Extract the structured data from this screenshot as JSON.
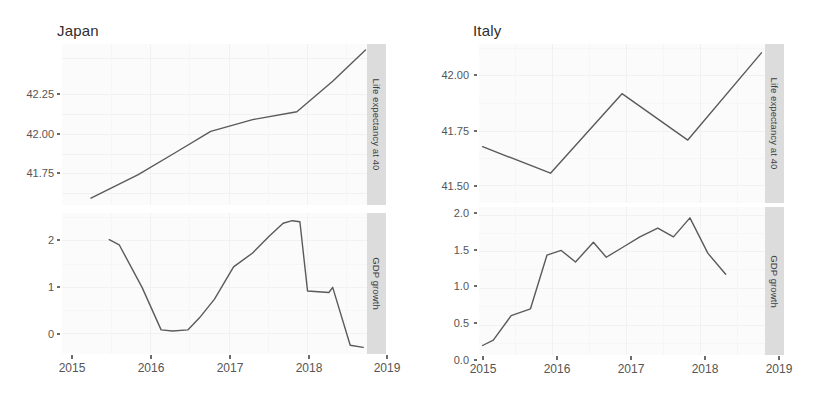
{
  "figure": {
    "background": "#ffffff",
    "panel_background": "#fbfbfb",
    "grid_color": "#f1f1f1",
    "strip_background": "#dcdcdc",
    "line_color": "#5a5a5a"
  },
  "facets": {
    "columns": [
      {
        "title": "Japan"
      },
      {
        "title": "Italy"
      }
    ],
    "rows": [
      {
        "strip_label": "Life expectancy at 40"
      },
      {
        "strip_label": "GDP growth"
      }
    ]
  },
  "axes": {
    "x_ticks": [
      "2015",
      "2016",
      "2017",
      "2018",
      "2019"
    ],
    "japan_life_y_ticks": [
      "42.25",
      "42.00",
      "41.75"
    ],
    "japan_gdp_y_ticks": [
      "2",
      "1",
      "0"
    ],
    "italy_life_y_ticks": [
      "42.00",
      "41.75",
      "41.50"
    ],
    "italy_gdp_y_ticks": [
      "2.0",
      "1.5",
      "1.0",
      "0.5",
      "0.0"
    ]
  },
  "chart_data": [
    {
      "type": "line",
      "title": "Japan",
      "ylabel": "Life expectancy at 40",
      "xlabel": "",
      "xlim": [
        2015.0,
        2019.0
      ],
      "ylim": [
        41.63,
        42.45
      ],
      "grid": true,
      "legend": "none",
      "yticks": [
        41.75,
        42.0,
        42.25
      ],
      "xticks": [
        2015,
        2016,
        2017,
        2018,
        2019
      ],
      "series": [
        {
          "name": "Life expectancy at 40",
          "x": [
            2015.38,
            2016.0,
            2016.5,
            2016.95,
            2017.5,
            2018.08,
            2018.55,
            2018.98
          ],
          "y": [
            41.665,
            41.785,
            41.9,
            42.005,
            42.065,
            42.105,
            42.26,
            42.42
          ]
        }
      ]
    },
    {
      "type": "line",
      "title": "Japan",
      "ylabel": "GDP growth",
      "xlabel": "",
      "xlim": [
        2015.0,
        2019.0
      ],
      "ylim": [
        -0.25,
        2.5
      ],
      "grid": true,
      "legend": "none",
      "yticks": [
        0,
        1,
        2
      ],
      "xticks": [
        2015,
        2016,
        2017,
        2018,
        2019
      ],
      "series": [
        {
          "name": "GDP growth",
          "x": [
            2015.62,
            2015.75,
            2016.05,
            2016.3,
            2016.45,
            2016.65,
            2016.8,
            2017.0,
            2017.25,
            2017.5,
            2017.72,
            2017.9,
            2018.02,
            2018.12,
            2018.22,
            2018.5,
            2018.55,
            2018.78,
            2018.95
          ],
          "y": [
            1.98,
            1.88,
            1.05,
            0.22,
            0.2,
            0.22,
            0.45,
            0.82,
            1.45,
            1.72,
            2.05,
            2.3,
            2.35,
            2.33,
            0.98,
            0.95,
            1.05,
            -0.08,
            -0.12
          ]
        }
      ]
    },
    {
      "type": "line",
      "title": "Italy",
      "ylabel": "Life expectancy at 40",
      "xlabel": "",
      "xlim": [
        2015.0,
        2019.0
      ],
      "ylim": [
        41.42,
        42.14
      ],
      "grid": true,
      "legend": "none",
      "yticks": [
        41.5,
        41.75,
        42.0
      ],
      "xticks": [
        2015,
        2016,
        2017,
        2018,
        2019
      ],
      "series": [
        {
          "name": "Life expectancy at 40",
          "x": [
            2015.05,
            2016.0,
            2017.0,
            2017.92,
            2018.95
          ],
          "y": [
            41.675,
            41.555,
            41.915,
            41.705,
            42.1
          ]
        }
      ]
    },
    {
      "type": "line",
      "title": "Italy",
      "ylabel": "GDP growth",
      "xlabel": "",
      "xlim": [
        2015.0,
        2019.0
      ],
      "ylim": [
        -0.08,
        2.1
      ],
      "grid": true,
      "legend": "none",
      "yticks": [
        0.0,
        0.5,
        1.0,
        1.5,
        2.0
      ],
      "xticks": [
        2015,
        2016,
        2017,
        2018,
        2019
      ],
      "series": [
        {
          "name": "GDP growth",
          "x": [
            2015.05,
            2015.2,
            2015.45,
            2015.72,
            2015.95,
            2016.15,
            2016.35,
            2016.6,
            2016.78,
            2017.0,
            2017.25,
            2017.5,
            2017.72,
            2017.95,
            2018.2,
            2018.45
          ],
          "y": [
            0.06,
            0.14,
            0.5,
            0.6,
            1.39,
            1.46,
            1.29,
            1.58,
            1.36,
            1.5,
            1.66,
            1.79,
            1.66,
            1.94,
            1.42,
            1.11
          ]
        }
      ]
    }
  ]
}
